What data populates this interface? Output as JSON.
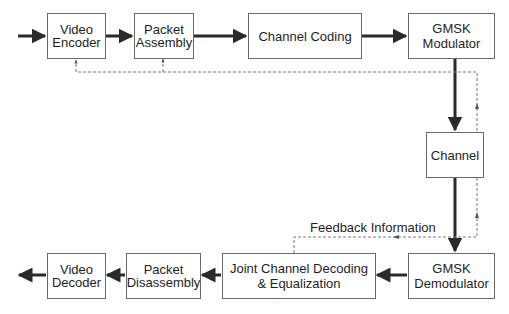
{
  "diagram": {
    "type": "block-diagram",
    "colors": {
      "solid_arrow": "#2a2a2a",
      "dashed_feedback": "#777777",
      "box_border": "#6a6a6a"
    },
    "blocks": {
      "video_encoder": {
        "line1": "Video",
        "line2": "Encoder"
      },
      "packet_assembly": {
        "line1": "Packet",
        "line2": "Assembly"
      },
      "channel_coding": {
        "line1": "Channel Coding"
      },
      "gmsk_modulator": {
        "line1": "GMSK",
        "line2": "Modulator"
      },
      "channel": {
        "line1": "Channel"
      },
      "gmsk_demodulator": {
        "line1": "GMSK",
        "line2": "Demodulator"
      },
      "joint_decoding": {
        "line1": "Joint Channel Decoding",
        "line2": "& Equalization"
      },
      "packet_disassembly": {
        "line1": "Packet",
        "line2": "Disassembly"
      },
      "video_decoder": {
        "line1": "Video",
        "line2": "Decoder"
      }
    },
    "feedback_label": "Feedback Information",
    "edges": [
      {
        "from": "input",
        "to": "Video Encoder",
        "style": "solid"
      },
      {
        "from": "Video Encoder",
        "to": "Packet Assembly",
        "style": "solid"
      },
      {
        "from": "Packet Assembly",
        "to": "Channel Coding",
        "style": "solid"
      },
      {
        "from": "Channel Coding",
        "to": "GMSK Modulator",
        "style": "solid"
      },
      {
        "from": "GMSK Modulator",
        "to": "Channel",
        "style": "solid"
      },
      {
        "from": "Channel",
        "to": "GMSK Demodulator",
        "style": "solid"
      },
      {
        "from": "GMSK Demodulator",
        "to": "Joint Channel Decoding & Equalization",
        "style": "solid"
      },
      {
        "from": "Joint Channel Decoding & Equalization",
        "to": "Packet Disassembly",
        "style": "solid"
      },
      {
        "from": "Packet Disassembly",
        "to": "Video Decoder",
        "style": "solid"
      },
      {
        "from": "Video Decoder",
        "to": "output",
        "style": "solid"
      },
      {
        "from": "Joint Channel Decoding & Equalization",
        "to": "Video Encoder",
        "style": "dashed",
        "label": "Feedback Information"
      },
      {
        "from": "Joint Channel Decoding & Equalization",
        "to": "Packet Assembly",
        "style": "dashed",
        "label": "Feedback Information"
      }
    ]
  }
}
